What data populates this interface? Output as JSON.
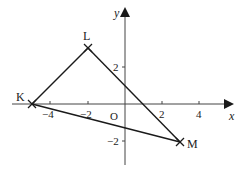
{
  "diagram": {
    "type": "coordinate-geometry-triangle",
    "colors": {
      "line": "#1a1a1a",
      "axis": "#444444",
      "text": "#222222",
      "background": "#ffffff"
    },
    "axes": {
      "x_label": "x",
      "y_label": "y",
      "origin_label": "O",
      "x_ticks": [
        {
          "value": -4,
          "label": "−4"
        },
        {
          "value": -2,
          "label": "−2"
        },
        {
          "value": 2,
          "label": "2"
        },
        {
          "value": 4,
          "label": "4"
        }
      ],
      "y_ticks": [
        {
          "value": 2,
          "label": "2"
        },
        {
          "value": -2,
          "label": "−2"
        }
      ]
    },
    "points": [
      {
        "name": "K",
        "x": -5,
        "y": 0,
        "marker": "cross"
      },
      {
        "name": "L",
        "x": -2,
        "y": 3,
        "marker": "cross"
      },
      {
        "name": "M",
        "x": 3,
        "y": -2,
        "marker": "cross"
      }
    ],
    "segments": [
      {
        "from": "K",
        "to": "L"
      },
      {
        "from": "L",
        "to": "M"
      },
      {
        "from": "K",
        "to": "M"
      }
    ]
  }
}
